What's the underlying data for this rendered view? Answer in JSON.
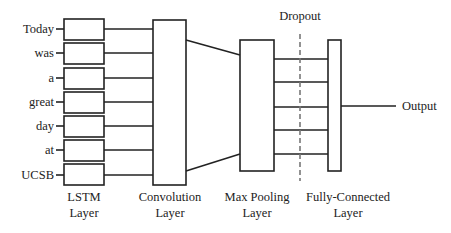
{
  "inputs": [
    "Today",
    "was",
    "a",
    "great",
    "day",
    "at",
    "UCSB"
  ],
  "layers": {
    "lstm": {
      "line1": "LSTM",
      "line2": "Layer"
    },
    "conv": {
      "line1": "Convolution",
      "line2": "Layer"
    },
    "pool": {
      "line1": "Max Pooling",
      "line2": "Layer"
    },
    "fc": {
      "line1": "Fully-Connected",
      "line2": "Layer"
    }
  },
  "dropout_label": "Dropout",
  "output_label": "Output",
  "colors": {
    "stroke": "#222222",
    "dash": "#777777",
    "background": "#ffffff"
  }
}
